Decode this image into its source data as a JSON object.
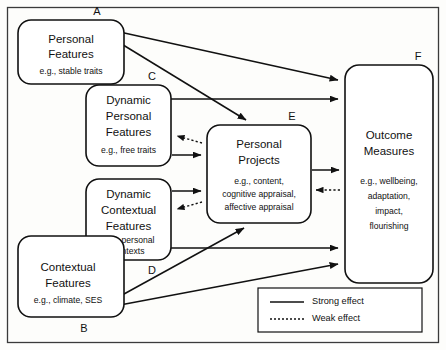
{
  "diagram": {
    "type": "flow-diagram",
    "nodes": [
      {
        "id": "A",
        "key": "personal_features",
        "label": "A",
        "title_lines": [
          "Personal",
          "Features"
        ],
        "subtitle": "e.g., stable traits",
        "x": 18,
        "y": 20,
        "w": 106,
        "h": 64
      },
      {
        "id": "C",
        "key": "dynamic_personal_features",
        "label": "C",
        "title_lines": [
          "Dynamic",
          "Personal",
          "Features"
        ],
        "subtitle": "e.g., free traits",
        "x": 86,
        "y": 85,
        "w": 85,
        "h": 81
      },
      {
        "id": "D",
        "key": "dynamic_contextual_features",
        "label": "D",
        "title_lines": [
          "Dynamic",
          "Contextual",
          "Features"
        ],
        "subtitle": "e.g., personal contexts",
        "x": 86,
        "y": 179,
        "w": 85,
        "h": 81
      },
      {
        "id": "B",
        "key": "contextual_features",
        "label": "B",
        "title_lines": [
          "Contextual",
          "Features"
        ],
        "subtitle": "e.g., climate, SES",
        "x": 18,
        "y": 236,
        "w": 106,
        "h": 81
      },
      {
        "id": "E",
        "key": "personal_projects",
        "label": "E",
        "title_lines": [
          "Personal",
          "Projects"
        ],
        "subtitle": "e.g., content, cognitive appraisal, affective appraisal",
        "x": 207,
        "y": 125,
        "w": 104,
        "h": 98
      },
      {
        "id": "F",
        "key": "outcome_measures",
        "label": "F",
        "title_lines": [
          "Outcome",
          "Measures"
        ],
        "subtitle": "e.g., wellbeing, adaptation, impact, flourishing",
        "x": 345,
        "y": 65,
        "w": 88,
        "h": 218
      }
    ],
    "edges": [
      {
        "from": "A",
        "to": "F",
        "strength": "strong",
        "note": "Personal Features to Outcome Measures"
      },
      {
        "from": "A",
        "to": "E",
        "strength": "strong",
        "note": "Personal Features to Personal Projects"
      },
      {
        "from": "C",
        "to": "F",
        "strength": "strong",
        "note": "Dynamic Personal Features to Outcome Measures"
      },
      {
        "from": "C",
        "to": "E",
        "strength": "strong",
        "note": "Dynamic Personal Features to Personal Projects"
      },
      {
        "from": "E",
        "to": "C",
        "strength": "weak",
        "note": "Personal Projects back to Dynamic Personal Features"
      },
      {
        "from": "D",
        "to": "E",
        "strength": "strong",
        "note": "Dynamic Contextual Features to Personal Projects"
      },
      {
        "from": "E",
        "to": "D",
        "strength": "weak",
        "note": "Personal Projects back to Dynamic Contextual Features"
      },
      {
        "from": "D",
        "to": "F",
        "strength": "strong",
        "note": "Dynamic Contextual Features to Outcome Measures"
      },
      {
        "from": "B",
        "to": "E",
        "strength": "strong",
        "note": "Contextual Features to Personal Projects"
      },
      {
        "from": "B",
        "to": "F",
        "strength": "strong",
        "note": "Contextual Features to Outcome Measures"
      },
      {
        "from": "E",
        "to": "F",
        "strength": "strong",
        "note": "Personal Projects to Outcome Measures"
      },
      {
        "from": "F",
        "to": "E",
        "strength": "weak",
        "note": "Outcome Measures back to Personal Projects"
      }
    ],
    "legend": {
      "x": 258,
      "y": 288,
      "w": 164,
      "h": 44,
      "items": [
        {
          "key": "strong",
          "label": "Strong effect",
          "style": "solid"
        },
        {
          "key": "weak",
          "label": "Weak effect",
          "style": "dotted"
        }
      ]
    },
    "colors": {
      "stroke": "#111111",
      "box_fill": "#ffffff",
      "background": "#fdfdfb",
      "frame": "#3a3a3a"
    }
  }
}
